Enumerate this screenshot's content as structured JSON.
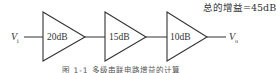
{
  "diagram": {
    "total_gain_label": "总的增益=45dB",
    "input_label": "V",
    "input_subscript": "i",
    "output_label": "V",
    "output_subscript": "o",
    "stages": [
      {
        "label": "20dB"
      },
      {
        "label": "15dB"
      },
      {
        "label": "10dB"
      }
    ],
    "caption": "图 1-1  多级串联电路增益的计算",
    "colors": {
      "stroke": "#333333",
      "background": "#ffffff"
    }
  }
}
